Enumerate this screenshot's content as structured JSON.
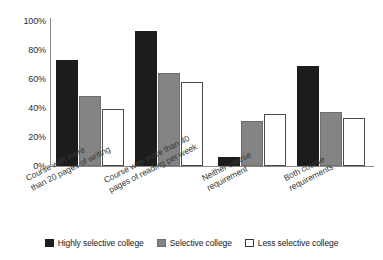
{
  "chart_data": {
    "type": "bar",
    "title": "",
    "xlabel": "",
    "ylabel": "",
    "ylim": [
      0,
      100
    ],
    "yticks": [
      "0%",
      "20%",
      "40%",
      "60%",
      "80%",
      "100%"
    ],
    "ytick_values": [
      0,
      20,
      40,
      60,
      80,
      100
    ],
    "grid": false,
    "legend_position": "bottom",
    "categories": [
      "Course with more\nthan 20 pages of writing",
      "Course with more than 40\npages of reading per week",
      "Neither course\nrequirement",
      "Both course\nrequirements"
    ],
    "category_lines": [
      [
        "Course with more",
        "than 20 pages of writing"
      ],
      [
        "Course with more than 40",
        "pages of reading per week"
      ],
      [
        "Neither course",
        "requirement"
      ],
      [
        "Both course",
        "requirements"
      ]
    ],
    "series": [
      {
        "name": "Highly selective college",
        "color": "#1c1c1c",
        "values": [
          73,
          93,
          6,
          69
        ]
      },
      {
        "name": "Selective college",
        "color": "#848484",
        "values": [
          48,
          64,
          31,
          37
        ]
      },
      {
        "name": "Less selective college",
        "color": "#ffffff",
        "values": [
          39,
          58,
          36,
          33
        ]
      }
    ]
  },
  "legend": {
    "items": [
      {
        "label": "Highly selective college",
        "swatch": "black"
      },
      {
        "label": "Selective college",
        "swatch": "gray"
      },
      {
        "label": "Less selective college",
        "swatch": "white"
      }
    ]
  }
}
